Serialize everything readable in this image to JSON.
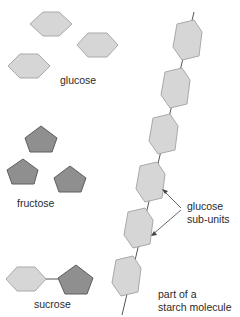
{
  "colors": {
    "glucose_fill": "#d6d6d6",
    "glucose_stroke": "#a9a9a9",
    "fructose_fill": "#8f8f8f",
    "fructose_stroke": "#5e5e5e",
    "bond": "#555555",
    "text": "#2a2a2a"
  },
  "labels": {
    "glucose": "glucose",
    "fructose": "fructose",
    "sucrose": "sucrose",
    "subunits_line1": "glucose",
    "subunits_line2": "sub-units",
    "starch_line1": "part of a",
    "starch_line2": "starch molecule"
  },
  "legend": {
    "glucose_shape": "hexagon",
    "fructose_shape": "pentagon"
  }
}
